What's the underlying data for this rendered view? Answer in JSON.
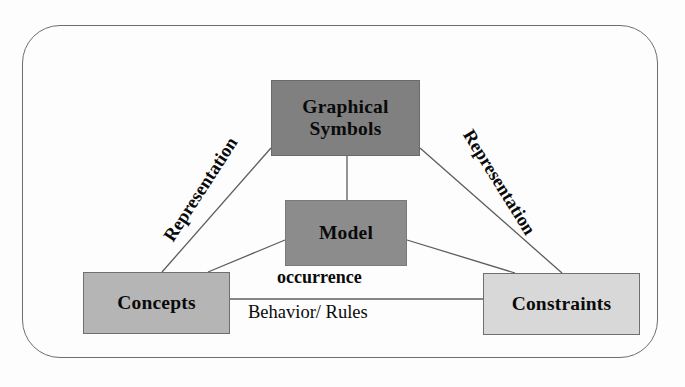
{
  "diagram": {
    "frame": {
      "shape": "rounded-rectangle",
      "border_color": "#6e6e70"
    },
    "nodes": [
      {
        "id": "graphical-symbols",
        "label": "Graphical\nSymbols",
        "line1": "Graphical",
        "line2": "Symbols",
        "fill": "#808080",
        "border": "#6b6b6b"
      },
      {
        "id": "model",
        "label": "Model",
        "fill": "#8c8c8c",
        "border": "#7a7a7a"
      },
      {
        "id": "concepts",
        "label": "Concepts",
        "fill": "#b5b5b5",
        "border": "#6f6f6f"
      },
      {
        "id": "constraints",
        "label": "Constraints",
        "fill": "#d8d8d8",
        "border": "#6f6f6f"
      }
    ],
    "edge_labels": {
      "representation_left": "Representation",
      "representation_right": "Representation",
      "occurrence": "occurrence",
      "behavior_rules": "Behavior/ Rules"
    },
    "edges": [
      {
        "from": "graphical-symbols",
        "to": "concepts",
        "label": "Representation"
      },
      {
        "from": "graphical-symbols",
        "to": "constraints",
        "label": "Representation"
      },
      {
        "from": "graphical-symbols",
        "to": "model",
        "label": ""
      },
      {
        "from": "model",
        "to": "concepts",
        "label": "occurrence"
      },
      {
        "from": "model",
        "to": "constraints",
        "label": "occurrence"
      },
      {
        "from": "concepts",
        "to": "constraints",
        "label": "Behavior/ Rules"
      }
    ],
    "line_color": "#5c5c5e"
  }
}
